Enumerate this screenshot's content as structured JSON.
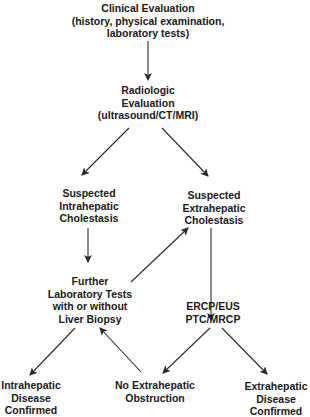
{
  "diagram": {
    "type": "flowchart",
    "colors": {
      "background": "#ffffff",
      "text": "#1a1a1a",
      "arrow": "#2a2a2a"
    },
    "nodes": [
      {
        "id": "clinical",
        "lines": [
          "Clinical Evaluation",
          "(history, physical examination,",
          "laboratory tests)"
        ]
      },
      {
        "id": "radiologic",
        "lines": [
          "Radiologic",
          "Evaluation",
          "(ultrasound/CT/MRI)"
        ]
      },
      {
        "id": "intrahepatic",
        "lines": [
          "Suspected",
          "Intrahepatic",
          "Cholestasis"
        ]
      },
      {
        "id": "extrahepatic",
        "lines": [
          "Suspected",
          "Extrahepatic",
          "Cholestasis"
        ]
      },
      {
        "id": "further_tests",
        "lines": [
          "Further",
          "Laboratory Tests",
          "with or without",
          "Liver Biopsy"
        ]
      },
      {
        "id": "ercp",
        "lines": [
          "ERCP/EUS",
          "PTC/MRCP"
        ]
      },
      {
        "id": "intra_confirmed",
        "lines": [
          "Intrahepatic",
          "Disease",
          "Confirmed"
        ]
      },
      {
        "id": "no_obstruction",
        "lines": [
          "No Extrahepatic",
          "Obstruction"
        ]
      },
      {
        "id": "extra_confirmed",
        "lines": [
          "Extrahepatic",
          "Disease",
          "Confirmed"
        ]
      }
    ],
    "edges": [
      {
        "from": "clinical",
        "to": "radiologic"
      },
      {
        "from": "radiologic",
        "to": "intrahepatic"
      },
      {
        "from": "radiologic",
        "to": "extrahepatic"
      },
      {
        "from": "intrahepatic",
        "to": "further_tests"
      },
      {
        "from": "further_tests",
        "to": "extrahepatic"
      },
      {
        "from": "extrahepatic",
        "to": "ercp"
      },
      {
        "from": "further_tests",
        "to": "intra_confirmed"
      },
      {
        "from": "no_obstruction",
        "to": "further_tests"
      },
      {
        "from": "ercp",
        "to": "no_obstruction"
      },
      {
        "from": "ercp",
        "to": "extra_confirmed"
      }
    ]
  }
}
